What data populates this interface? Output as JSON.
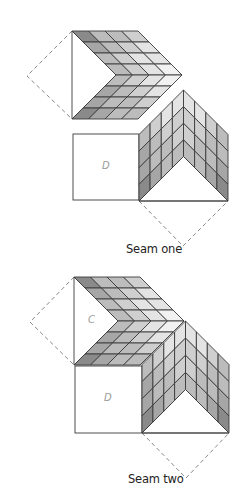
{
  "colors": {
    "stroke": "#3a3a3a",
    "dashed": "#7a7a7a",
    "shades": [
      "#8a8a8a",
      "#a6a6a6",
      "#bcbcbc",
      "#cfcfcf",
      "#e4e4e4",
      "#f1f1f1"
    ]
  },
  "figures": [
    {
      "id": "seam-one",
      "caption": "Seam one",
      "caption_pos": [
        126,
        242
      ],
      "top_chevron": {
        "left_x": 72,
        "top_y": 31,
        "bottom_y": 119,
        "mid_y": 75,
        "cell_w": 16.5,
        "rows": 4,
        "cols": 4,
        "shade_top": [
          [
            0,
            2,
            2,
            3
          ],
          [
            1,
            2,
            3,
            4
          ],
          [
            2,
            3,
            4,
            4
          ],
          [
            2,
            3,
            4,
            5
          ]
        ],
        "shade_bottom": [
          [
            2,
            3,
            4,
            5
          ],
          [
            1,
            2,
            3,
            4
          ],
          [
            1,
            2,
            2,
            3
          ],
          [
            0,
            1,
            2,
            2
          ]
        ]
      },
      "bottom_chevron": {
        "left_x": 139,
        "right_x": 228,
        "base_y": 201,
        "top_apex_y": 90,
        "shade_left": [
          [
            2,
            3,
            4,
            4
          ],
          [
            1,
            2,
            3,
            3
          ],
          [
            1,
            2,
            2,
            3
          ],
          [
            0,
            1,
            2,
            2
          ]
        ],
        "shade_right": [
          [
            4,
            4,
            3,
            2
          ],
          [
            3,
            3,
            2,
            2
          ],
          [
            3,
            2,
            2,
            1
          ],
          [
            2,
            2,
            1,
            0
          ]
        ]
      },
      "square": {
        "x": 73,
        "y": 134,
        "size": 66,
        "label": "D"
      },
      "square_label": "D",
      "top_label": "",
      "dashed_left_apex": [
        27,
        76
      ],
      "dashed_bottom_apex": [
        183,
        246
      ]
    },
    {
      "id": "seam-two",
      "caption": "Seam two",
      "caption_pos": [
        128,
        472
      ],
      "top_chevron": {
        "left_x": 74,
        "top_y": 277,
        "bottom_y": 365,
        "mid_y": 321,
        "cell_w": 16.5,
        "rows": 4,
        "cols": 4,
        "shade_top": [
          [
            0,
            2,
            2,
            3
          ],
          [
            1,
            2,
            3,
            4
          ],
          [
            2,
            3,
            4,
            4
          ],
          [
            2,
            3,
            4,
            5
          ]
        ],
        "shade_bottom": [
          [
            2,
            3,
            4,
            5
          ],
          [
            1,
            2,
            3,
            4
          ],
          [
            1,
            2,
            2,
            3
          ],
          [
            0,
            1,
            2,
            2
          ]
        ]
      },
      "bottom_chevron": {
        "left_x": 142,
        "right_x": 229,
        "base_y": 433,
        "top_apex_y": 321,
        "shade_left": [
          [
            2,
            3,
            4,
            4
          ],
          [
            1,
            2,
            3,
            3
          ],
          [
            1,
            2,
            2,
            3
          ],
          [
            0,
            1,
            2,
            2
          ]
        ],
        "shade_right": [
          [
            4,
            4,
            3,
            2
          ],
          [
            3,
            3,
            2,
            2
          ],
          [
            3,
            2,
            2,
            1
          ],
          [
            2,
            2,
            1,
            0
          ]
        ]
      },
      "square": {
        "x": 75,
        "y": 366,
        "size": 67,
        "label": "D"
      },
      "square_label": "D",
      "top_label": "C",
      "dashed_left_apex": [
        30,
        322
      ],
      "dashed_bottom_apex": [
        186,
        478
      ]
    }
  ],
  "labels": {
    "seam_one": "Seam one",
    "seam_two": "Seam two",
    "square_d_1": "D",
    "square_d_2": "D",
    "region_c": "C"
  }
}
